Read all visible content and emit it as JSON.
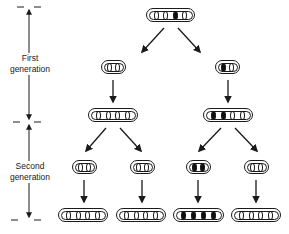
{
  "title": "",
  "scale": {
    "labels": [
      {
        "id": "first",
        "line1": "First",
        "line2": "generation"
      },
      {
        "id": "second",
        "line1": "Second",
        "line2": "generation"
      }
    ]
  },
  "legend": {
    "open_symbol": "0 (unlabeled / light chromatid)",
    "filled_symbol": "● (labeled / dark chromatid)"
  },
  "nodes": [
    {
      "id": "root",
      "pattern": [
        "o",
        "o",
        "d",
        "o"
      ],
      "x": 146,
      "y": 8,
      "w": 49
    },
    {
      "id": "g1-left",
      "pattern": [
        "o",
        "o"
      ],
      "x": 101,
      "y": 60,
      "w": 25
    },
    {
      "id": "g1-right",
      "pattern": [
        "d",
        "o"
      ],
      "x": 215,
      "y": 60,
      "w": 25
    },
    {
      "id": "g1-left-dup",
      "pattern": [
        "o",
        "o",
        "o",
        "o"
      ],
      "x": 88,
      "y": 108,
      "w": 50
    },
    {
      "id": "g1-right-dup",
      "pattern": [
        "d",
        "d",
        "o",
        "o"
      ],
      "x": 203,
      "y": 108,
      "w": 50
    },
    {
      "id": "g2-a",
      "pattern": [
        "o",
        "o"
      ],
      "x": 72,
      "y": 160,
      "w": 25
    },
    {
      "id": "g2-b",
      "pattern": [
        "o",
        "o"
      ],
      "x": 130,
      "y": 160,
      "w": 25
    },
    {
      "id": "g2-c",
      "pattern": [
        "d",
        "d"
      ],
      "x": 186,
      "y": 160,
      "w": 25
    },
    {
      "id": "g2-d",
      "pattern": [
        "o",
        "o"
      ],
      "x": 244,
      "y": 160,
      "w": 25
    },
    {
      "id": "g2-a-dup",
      "pattern": [
        "o",
        "o",
        "o",
        "o"
      ],
      "x": 58,
      "y": 208,
      "w": 50
    },
    {
      "id": "g2-b-dup",
      "pattern": [
        "o",
        "o",
        "o",
        "o"
      ],
      "x": 116,
      "y": 208,
      "w": 50
    },
    {
      "id": "g2-c-dup",
      "pattern": [
        "d",
        "d",
        "d",
        "d"
      ],
      "x": 173,
      "y": 208,
      "w": 51
    },
    {
      "id": "g2-d-dup",
      "pattern": [
        "o",
        "o",
        "o",
        "o"
      ],
      "x": 231,
      "y": 208,
      "w": 50
    }
  ],
  "edges": [
    {
      "from": "root",
      "to": "g1-left",
      "x1": 164,
      "y1": 28,
      "x2": 142,
      "y2": 52
    },
    {
      "from": "root",
      "to": "g1-right",
      "x1": 178,
      "y1": 28,
      "x2": 200,
      "y2": 52
    },
    {
      "from": "g1-left",
      "to": "g1-left-dup",
      "x1": 113,
      "y1": 80,
      "x2": 113,
      "y2": 102
    },
    {
      "from": "g1-right",
      "to": "g1-right-dup",
      "x1": 228,
      "y1": 80,
      "x2": 228,
      "y2": 102
    },
    {
      "from": "g1-left-dup",
      "to": "g2-a",
      "x1": 106,
      "y1": 128,
      "x2": 86,
      "y2": 151
    },
    {
      "from": "g1-left-dup",
      "to": "g2-b",
      "x1": 120,
      "y1": 128,
      "x2": 141,
      "y2": 151
    },
    {
      "from": "g1-right-dup",
      "to": "g2-c",
      "x1": 221,
      "y1": 128,
      "x2": 199,
      "y2": 151
    },
    {
      "from": "g1-right-dup",
      "to": "g2-d",
      "x1": 235,
      "y1": 128,
      "x2": 257,
      "y2": 151
    },
    {
      "from": "g2-a",
      "to": "g2-a-dup",
      "x1": 84,
      "y1": 180,
      "x2": 84,
      "y2": 202
    },
    {
      "from": "g2-b",
      "to": "g2-b-dup",
      "x1": 142,
      "y1": 180,
      "x2": 142,
      "y2": 202
    },
    {
      "from": "g2-c",
      "to": "g2-c-dup",
      "x1": 198,
      "y1": 180,
      "x2": 198,
      "y2": 202
    },
    {
      "from": "g2-d",
      "to": "g2-d-dup",
      "x1": 256,
      "y1": 180,
      "x2": 256,
      "y2": 202
    }
  ],
  "colors": {
    "ink": "#1a1a1a",
    "background": "#ffffff"
  }
}
